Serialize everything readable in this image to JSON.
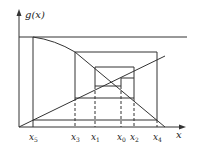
{
  "diagram": {
    "type": "cobweb",
    "y_axis_label": "g(x)",
    "x_axis_label": "x",
    "ticks": [
      {
        "name": "x",
        "sub": "5",
        "px": 33
      },
      {
        "name": "x",
        "sub": "3",
        "px": 75
      },
      {
        "name": "x",
        "sub": "1",
        "px": 95
      },
      {
        "name": "x",
        "sub": "0",
        "px": 121
      },
      {
        "name": "x",
        "sub": "2",
        "px": 134
      },
      {
        "name": "x",
        "sub": "4",
        "px": 157
      }
    ],
    "colors": {
      "line": "#333333",
      "background": "#ffffff"
    }
  }
}
